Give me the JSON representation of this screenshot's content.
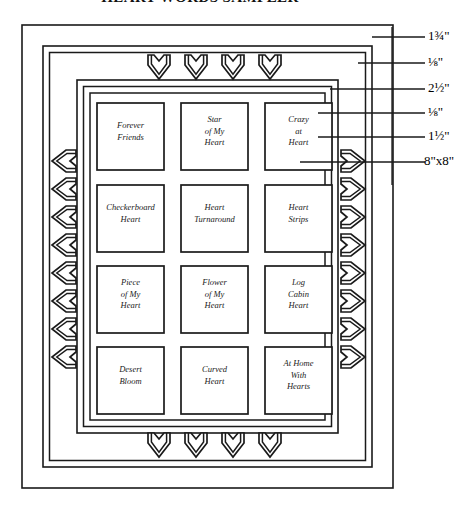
{
  "title": "HEART WORDS SAMPLER",
  "diagram": {
    "type": "quilt-layout-diagram",
    "grid": {
      "columns": 3,
      "rows": 4,
      "blocks": [
        {
          "row": 1,
          "column": 1,
          "label": "Forever\nFriends"
        },
        {
          "row": 1,
          "column": 2,
          "label": "Star\nof My\nHeart"
        },
        {
          "row": 1,
          "column": 3,
          "label": "Crazy\nat\nHeart"
        },
        {
          "row": 2,
          "column": 1,
          "label": "Checkerboard\nHeart"
        },
        {
          "row": 2,
          "column": 2,
          "label": "Heart\nTurnaround"
        },
        {
          "row": 2,
          "column": 3,
          "label": "Heart\nStrips"
        },
        {
          "row": 3,
          "column": 1,
          "label": "Piece\nof My\nHeart"
        },
        {
          "row": 3,
          "column": 2,
          "label": "Flower\nof My\nHeart"
        },
        {
          "row": 3,
          "column": 3,
          "label": "Log\nCabin\nHeart"
        },
        {
          "row": 4,
          "column": 1,
          "label": "Desert\nBloom"
        },
        {
          "row": 4,
          "column": 2,
          "label": "Curved\nHeart"
        },
        {
          "row": 4,
          "column": 3,
          "label": "At Home\nWith\nHearts"
        }
      ]
    },
    "heart_bands": {
      "top_count": 4,
      "bottom_count": 4,
      "left_count": 8,
      "right_count": 8,
      "style": "outlined-heart"
    },
    "dimensions": [
      {
        "id": "outer-border",
        "label": "1¾\""
      },
      {
        "id": "inner-narrow-border-1",
        "label": "⅛\""
      },
      {
        "id": "heart-band-border",
        "label": "2½\""
      },
      {
        "id": "inner-narrow-border-2",
        "label": "⅛\""
      },
      {
        "id": "sashing-border",
        "label": "1½\""
      },
      {
        "id": "block-size",
        "label": "8\"x8\""
      }
    ]
  },
  "colors": {
    "line": "#1a1a1a",
    "background": "#ffffff"
  }
}
